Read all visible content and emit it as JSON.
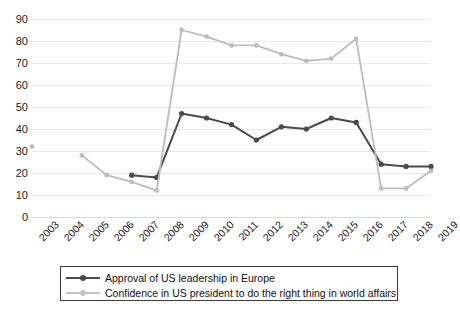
{
  "chart_data": {
    "type": "line",
    "title": "",
    "xlabel": "",
    "ylabel": "",
    "ylim": [
      0,
      90
    ],
    "ytick_step": 10,
    "grid": true,
    "legend_position": "bottom",
    "x": [
      "2003",
      "2004",
      "2005",
      "2006",
      "2007",
      "2008",
      "2009",
      "2010",
      "2011",
      "2012",
      "2013",
      "2014",
      "2015",
      "2016",
      "2017",
      "2018",
      "2019"
    ],
    "ytick_labels": [
      "90",
      "80",
      "70",
      "60",
      "50",
      "40",
      "30",
      "20",
      "10",
      "0"
    ],
    "series": [
      {
        "name": "Approval of US leadership in Europe",
        "color": "#4a4a4a",
        "values": [
          null,
          null,
          null,
          null,
          19,
          18,
          47,
          45,
          42,
          35,
          41,
          40,
          45,
          43,
          24,
          23,
          23
        ]
      },
      {
        "name": "Confidence in US president to do the right thing in world affairs",
        "color": "#bdbdbd",
        "values": [
          32,
          null,
          28,
          19,
          16,
          12,
          85,
          82,
          78,
          78,
          74,
          71,
          72,
          81,
          13,
          13,
          21
        ]
      }
    ]
  },
  "legend": {
    "items": [
      {
        "label": "Approval of US leadership in Europe"
      },
      {
        "label": "Confidence in US president to do the right thing in world affairs"
      }
    ]
  },
  "colors": {
    "series_dark": "#4a4a4a",
    "series_light": "#bdbdbd",
    "grid": "#e9e9ea",
    "text": "#1c1c1c",
    "legend_border": "#3b3b3b",
    "background": "#ffffff"
  }
}
